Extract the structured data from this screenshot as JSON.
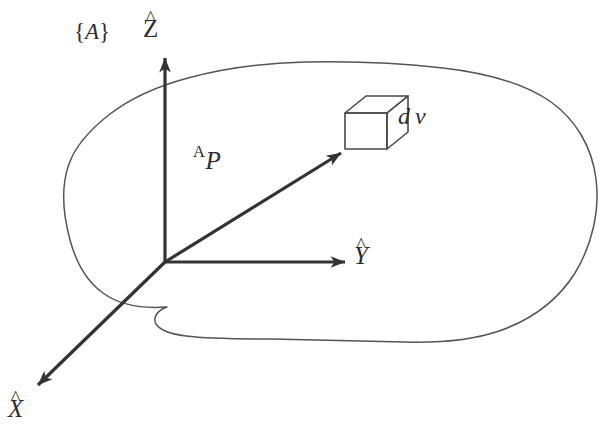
{
  "figure": {
    "kind": "vector-diagram",
    "background_color": "#ffffff",
    "ink_color": "#2e2e2e",
    "outline_color": "#555555"
  },
  "labels": {
    "frame": {
      "open_brace": "{",
      "name": "A",
      "close_brace": "}"
    },
    "axis_z": {
      "hat": "^",
      "letter": "Z"
    },
    "axis_y": {
      "hat": "^",
      "letter": "Y"
    },
    "axis_x": {
      "hat": "^",
      "letter": "X"
    },
    "position_vector": {
      "leading_superscript": "A",
      "symbol": "P"
    },
    "volume_element": {
      "differential": "d",
      "symbol": "v"
    }
  },
  "geometry": {
    "origin": {
      "x": 165,
      "y": 262
    },
    "axis_z_tip": {
      "x": 165,
      "y": 52
    },
    "axis_y_tip": {
      "x": 351,
      "y": 262
    },
    "axis_x_tip": {
      "x": 33,
      "y": 389
    },
    "vector_p_tip": {
      "x": 346,
      "y": 149
    },
    "cube_front_face": {
      "x": 345,
      "y": 113,
      "width": 42,
      "height": 36
    },
    "cube_depth": {
      "dx": 21,
      "dy": -17
    }
  }
}
